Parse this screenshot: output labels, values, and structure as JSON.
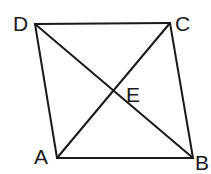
{
  "diagram": {
    "type": "quadrilateral-with-diagonals",
    "stroke_color": "#1a1a1a",
    "background": "#ffffff",
    "points": {
      "A": {
        "x": 57,
        "y": 158
      },
      "B": {
        "x": 193,
        "y": 158
      },
      "C": {
        "x": 170,
        "y": 23
      },
      "D": {
        "x": 35,
        "y": 24
      },
      "E": {
        "x": 113,
        "y": 91
      }
    },
    "labels": {
      "A": "A",
      "B": "B",
      "C": "C",
      "D": "D",
      "E": "E"
    },
    "segments": [
      "AB",
      "BC",
      "CD",
      "DA",
      "AC",
      "BD"
    ],
    "intersection": "E"
  }
}
